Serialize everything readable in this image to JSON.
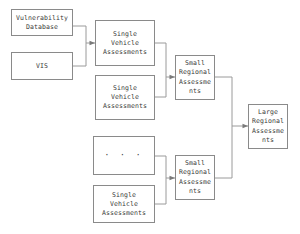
{
  "diagram": {
    "type": "flowchart",
    "background_color": "#ffffff",
    "border_color": "#8a8a8a",
    "wire_color": "#9a9a9a",
    "text_color": "#3a3a3a",
    "nodes": [
      {
        "id": "vulnerability-database",
        "label": "Vulnerability\nDatabase",
        "x": 11,
        "y": 9,
        "w": 62,
        "h": 27,
        "style": "wide"
      },
      {
        "id": "vis",
        "label": "VIS",
        "x": 11,
        "y": 52,
        "w": 62,
        "h": 28,
        "style": "wide"
      },
      {
        "id": "single-vehicle-assessments-1",
        "label": "Single\nVehicle\nAssessments",
        "x": 95,
        "y": 20,
        "w": 60,
        "h": 46,
        "style": "wide"
      },
      {
        "id": "single-vehicle-assessments-2",
        "label": "Single\nVehicle\nAssessments",
        "x": 95,
        "y": 75,
        "w": 60,
        "h": 45,
        "style": "wide"
      },
      {
        "id": "ellipsis-vehicles",
        "label": "· · ·",
        "x": 93,
        "y": 136,
        "w": 62,
        "h": 39,
        "style": "ellipsis"
      },
      {
        "id": "single-vehicle-assessments-3",
        "label": "Single\nVehicle\nAssessments",
        "x": 93,
        "y": 185,
        "w": 62,
        "h": 38,
        "style": "wide"
      },
      {
        "id": "small-regional-assessments-1",
        "label": "Small\nRegional\nAssessme\nnts",
        "x": 175,
        "y": 55,
        "w": 40,
        "h": 45,
        "style": "narrow"
      },
      {
        "id": "small-regional-assessments-2",
        "label": "Small\nRegional\nAssessme\nnts",
        "x": 175,
        "y": 155,
        "w": 40,
        "h": 45,
        "style": "narrow"
      },
      {
        "id": "large-regional-assessments",
        "label": "Large\nRegional\nAssessme\nnts",
        "x": 248,
        "y": 104,
        "w": 40,
        "h": 45,
        "style": "narrow"
      }
    ],
    "edges": [
      {
        "id": "edge-vulndb-to-svа1",
        "from": "vulnerability-database",
        "to": "single-vehicle-assessments-1"
      },
      {
        "id": "edge-vis-to-sva1",
        "from": "vis",
        "to": "single-vehicle-assessments-1"
      },
      {
        "id": "edge-sva1-to-sra1",
        "from": "single-vehicle-assessments-1",
        "to": "small-regional-assessments-1"
      },
      {
        "id": "edge-sva2-to-sra1",
        "from": "single-vehicle-assessments-2",
        "to": "small-regional-assessments-1"
      },
      {
        "id": "edge-ellipsis-to-sra2",
        "from": "ellipsis-vehicles",
        "to": "small-regional-assessments-2"
      },
      {
        "id": "edge-sva3-to-sra2",
        "from": "single-vehicle-assessments-3",
        "to": "small-regional-assessments-2"
      },
      {
        "id": "edge-sra1-to-lra",
        "from": "small-regional-assessments-1",
        "to": "large-regional-assessments"
      },
      {
        "id": "edge-sra2-to-lra",
        "from": "small-regional-assessments-2",
        "to": "large-regional-assessments"
      }
    ]
  }
}
